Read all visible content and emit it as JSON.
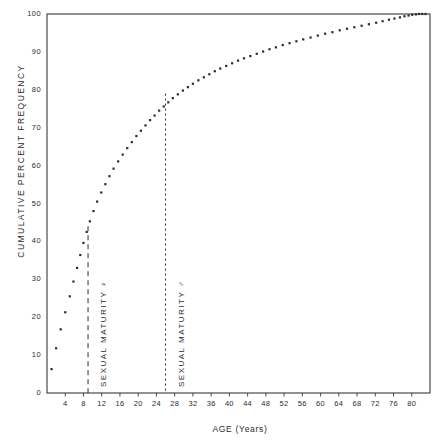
{
  "chart_data": {
    "type": "scatter",
    "title": "",
    "subtitle": "",
    "xlabel": "AGE (Years)",
    "ylabel": "CUMULATIVE PERCENT FREQUENCY",
    "xlim": [
      0,
      84
    ],
    "ylim": [
      0,
      100
    ],
    "grid": false,
    "legend": null,
    "xticks": [
      4,
      8,
      12,
      16,
      20,
      24,
      28,
      32,
      36,
      40,
      44,
      48,
      52,
      56,
      60,
      64,
      68,
      72,
      76,
      80
    ],
    "xtick_labels": [
      "4",
      "8",
      "12",
      "16",
      "20",
      "24",
      "28",
      "32",
      "36",
      "40",
      "44",
      "48",
      "52",
      "56",
      "60",
      "64",
      "68",
      "72",
      "76",
      "80"
    ],
    "yticks": [
      0,
      10,
      20,
      30,
      40,
      50,
      60,
      70,
      80,
      90,
      100
    ],
    "ytick_labels": [
      "0",
      "10",
      "20",
      "30",
      "40",
      "50",
      "60",
      "70",
      "80",
      "90",
      "100"
    ],
    "series": [
      {
        "name": "cumulative percent frequency",
        "marker": "square-dot",
        "color": "#2b2b2b",
        "points": [
          [
            1.0,
            6.3
          ],
          [
            2.0,
            11.8
          ],
          [
            3.0,
            16.8
          ],
          [
            4.0,
            21.3
          ],
          [
            5.0,
            25.5
          ],
          [
            5.8,
            29.4
          ],
          [
            6.6,
            33.0
          ],
          [
            7.3,
            36.4
          ],
          [
            8.0,
            39.6
          ],
          [
            8.7,
            42.5
          ],
          [
            9.4,
            45.3
          ],
          [
            10.2,
            48.0
          ],
          [
            11.0,
            50.5
          ],
          [
            11.9,
            52.9
          ],
          [
            12.8,
            55.1
          ],
          [
            13.7,
            57.2
          ],
          [
            14.6,
            59.2
          ],
          [
            15.6,
            61.1
          ],
          [
            16.6,
            62.9
          ],
          [
            17.6,
            64.6
          ],
          [
            18.6,
            66.2
          ],
          [
            19.6,
            67.8
          ],
          [
            20.6,
            69.2
          ],
          [
            21.6,
            70.6
          ],
          [
            22.6,
            72.0
          ],
          [
            23.6,
            73.2
          ],
          [
            24.6,
            74.5
          ],
          [
            25.6,
            75.6
          ],
          [
            26.6,
            76.7
          ],
          [
            27.6,
            77.8
          ],
          [
            28.7,
            78.8
          ],
          [
            29.8,
            79.8
          ],
          [
            30.9,
            80.7
          ],
          [
            32.0,
            81.6
          ],
          [
            33.2,
            82.5
          ],
          [
            34.4,
            83.3
          ],
          [
            35.6,
            84.1
          ],
          [
            36.8,
            84.9
          ],
          [
            38.0,
            85.6
          ],
          [
            39.3,
            86.3
          ],
          [
            40.6,
            87.0
          ],
          [
            41.9,
            87.7
          ],
          [
            43.2,
            88.3
          ],
          [
            44.6,
            88.9
          ],
          [
            46.0,
            89.5
          ],
          [
            47.4,
            90.1
          ],
          [
            48.8,
            90.7
          ],
          [
            50.2,
            91.2
          ],
          [
            51.7,
            91.8
          ],
          [
            53.2,
            92.3
          ],
          [
            54.7,
            92.8
          ],
          [
            56.2,
            93.3
          ],
          [
            57.8,
            93.8
          ],
          [
            59.4,
            94.3
          ],
          [
            61.0,
            94.8
          ],
          [
            62.6,
            95.2
          ],
          [
            64.2,
            95.7
          ],
          [
            65.8,
            96.1
          ],
          [
            67.4,
            96.5
          ],
          [
            69.0,
            96.9
          ],
          [
            70.6,
            97.3
          ],
          [
            72.2,
            97.7
          ],
          [
            73.6,
            98.1
          ],
          [
            75.0,
            98.5
          ],
          [
            76.2,
            98.8
          ],
          [
            77.4,
            99.1
          ],
          [
            78.4,
            99.4
          ],
          [
            79.3,
            99.6
          ],
          [
            80.1,
            99.8
          ],
          [
            80.9,
            99.9
          ],
          [
            81.6,
            100.0
          ],
          [
            82.3,
            100.0
          ],
          [
            83.0,
            100.0
          ]
        ]
      }
    ],
    "annotations": [
      {
        "id": "sexual-maturity-female",
        "label": "SEXUAL  MATURITY  ♀",
        "x": 9.0,
        "y_top": 44.0,
        "y_bottom": 0.0,
        "line_style": "dashed"
      },
      {
        "id": "sexual-maturity-male",
        "label": "SEXUAL  MATURITY  ♂",
        "x": 26.0,
        "y_top": 79.0,
        "y_bottom": 0.0,
        "line_style": "dotted"
      }
    ]
  }
}
